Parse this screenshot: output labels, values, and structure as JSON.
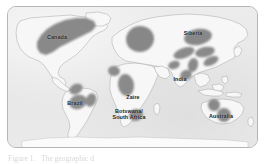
{
  "figure": {
    "kind": "world-map-figure",
    "caption_partial": "Figure 1.   The geographic d",
    "frame": {
      "border_color": "#b5b5b6",
      "corner_radius_px": 9
    }
  },
  "map": {
    "projection_note": "equirectangular world outline",
    "ocean_color": "#e9e9e9",
    "land_color": "#f6f6f6",
    "coastline_color": "#a9a9a9",
    "highlight_color": "#8b8b8b",
    "highlight_color_dark": "#7e7e7e",
    "labels": [
      {
        "name": "canada",
        "text": "Canada",
        "x": 48,
        "y": 30
      },
      {
        "name": "brazil",
        "text": "Brazil",
        "x": 68,
        "y": 96
      },
      {
        "name": "zaire",
        "text": "Zaire",
        "x": 126,
        "y": 90
      },
      {
        "name": "botswana",
        "text": "Botswana/\nSouth Africa",
        "x": 120,
        "y": 105
      },
      {
        "name": "siberia",
        "text": "Siberia",
        "x": 185,
        "y": 26
      },
      {
        "name": "india",
        "text": "India",
        "x": 172,
        "y": 72
      },
      {
        "name": "australia",
        "text": "Australia",
        "x": 213,
        "y": 109
      }
    ],
    "highlighted_regions": [
      {
        "name": "canada-shield",
        "label": "Canada"
      },
      {
        "name": "brazil-amazon-shield",
        "label": "Brazil"
      },
      {
        "name": "guyana-shield",
        "label": "Brazil"
      },
      {
        "name": "zaire-congo-craton",
        "label": "Zaire"
      },
      {
        "name": "botswana-kaapvaal-craton",
        "label": "Botswana/South Africa"
      },
      {
        "name": "baltic-shield",
        "label": ""
      },
      {
        "name": "siberian-craton",
        "label": "Siberia"
      },
      {
        "name": "central-asia-belt",
        "label": ""
      },
      {
        "name": "india-dharwar-craton",
        "label": "India"
      },
      {
        "name": "australia-yilgarn-craton",
        "label": "Australia"
      },
      {
        "name": "australia-pilbara-craton",
        "label": "Australia"
      }
    ]
  }
}
